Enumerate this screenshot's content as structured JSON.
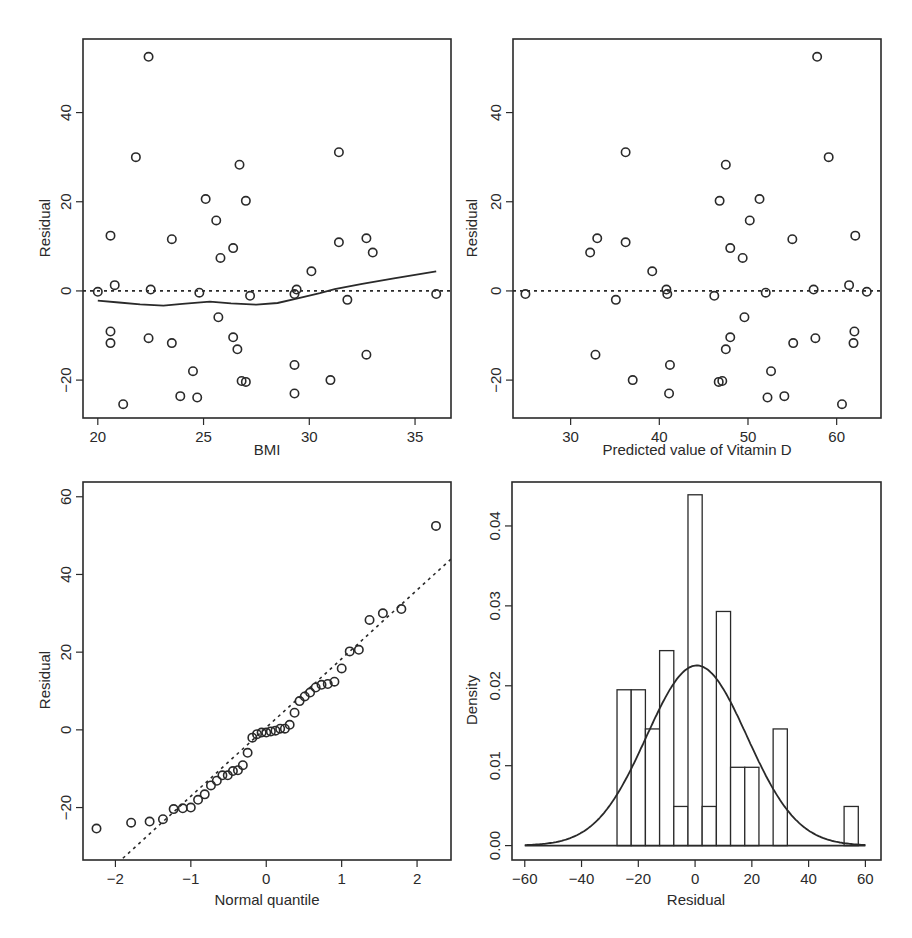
{
  "chart_data": [
    {
      "id": "bmi_residual",
      "type": "scatter",
      "title": "",
      "xlabel": "BMI",
      "ylabel": "Residual",
      "xlim": [
        19.3,
        36.7
      ],
      "ylim": [
        -28.5,
        56.5
      ],
      "xticks": [
        20,
        25,
        30,
        35
      ],
      "yticks": [
        -20,
        0,
        20,
        40
      ],
      "grid": false,
      "reference_line": {
        "type": "horizontal",
        "y": 0,
        "style": "dotted"
      },
      "smoother": {
        "type": "lowess",
        "x": [
          20.0,
          21.0,
          22.0,
          23.1,
          24.0,
          25.3,
          26.3,
          27.5,
          28.5,
          29.5,
          30.5,
          31.2,
          32.5,
          34.0,
          36.0
        ],
        "y": [
          -2.2,
          -2.6,
          -3.0,
          -3.3,
          -2.9,
          -2.4,
          -2.8,
          -3.1,
          -2.7,
          -1.6,
          -0.5,
          0.4,
          1.6,
          2.8,
          4.4
        ]
      },
      "x": [
        20.0,
        20.6,
        20.8,
        20.6,
        20.6,
        21.2,
        21.8,
        22.4,
        22.5,
        22.4,
        23.5,
        23.5,
        23.9,
        24.5,
        24.7,
        24.8,
        25.1,
        25.6,
        25.8,
        25.7,
        26.4,
        26.4,
        26.6,
        26.7,
        26.8,
        27.0,
        27.0,
        27.2,
        29.3,
        29.3,
        29.4,
        29.3,
        30.1,
        31.0,
        31.4,
        31.4,
        31.8,
        32.7,
        33.0,
        32.7,
        36.0
      ],
      "y": [
        -0.2,
        12.4,
        1.3,
        -9.1,
        -11.7,
        -25.4,
        30.0,
        52.5,
        0.3,
        -10.6,
        11.6,
        -11.7,
        -23.6,
        -18.0,
        -23.9,
        -0.4,
        20.6,
        15.8,
        7.4,
        -5.9,
        9.6,
        -10.4,
        -13.1,
        28.3,
        -20.2,
        -20.4,
        20.2,
        -1.1,
        -16.6,
        -23.0,
        0.3,
        -0.7,
        4.4,
        -20.0,
        31.1,
        10.9,
        -2.0,
        11.8,
        8.6,
        -14.3,
        -0.7
      ]
    },
    {
      "id": "predicted_residual",
      "type": "scatter",
      "title": "",
      "xlabel": "Predicted value of Vitamin D",
      "ylabel": "Residual",
      "xlim": [
        23.5,
        65.0
      ],
      "ylim": [
        -28.5,
        56.5
      ],
      "xticks": [
        30,
        40,
        50,
        60
      ],
      "yticks": [
        -20,
        0,
        20,
        40
      ],
      "grid": false,
      "reference_line": {
        "type": "horizontal",
        "y": 0,
        "style": "dotted"
      },
      "x": [
        24.9,
        32.2,
        33.0,
        32.8,
        35.1,
        36.2,
        36.2,
        37.0,
        39.2,
        40.8,
        40.9,
        41.2,
        41.1,
        46.2,
        46.8,
        46.7,
        47.1,
        47.5,
        47.5,
        48.0,
        48.0,
        49.4,
        49.6,
        50.2,
        51.3,
        52.0,
        52.2,
        52.6,
        54.1,
        55.0,
        55.1,
        57.4,
        57.6,
        57.8,
        59.1,
        60.6,
        61.4,
        61.9,
        62.0,
        62.1,
        63.4
      ],
      "y": [
        -0.7,
        8.6,
        11.8,
        -14.3,
        -2.0,
        31.1,
        10.9,
        -20.0,
        4.4,
        0.3,
        -0.7,
        -16.6,
        -23.0,
        -1.1,
        20.2,
        -20.4,
        -20.2,
        28.3,
        -13.1,
        9.6,
        -10.4,
        7.4,
        -5.9,
        15.8,
        20.6,
        -0.4,
        -23.9,
        -18.0,
        -23.6,
        11.6,
        -11.7,
        0.3,
        -10.6,
        52.5,
        30.0,
        -25.4,
        1.3,
        -11.7,
        -9.1,
        12.4,
        -0.2
      ]
    },
    {
      "id": "normal_qq",
      "type": "scatter",
      "title": "",
      "xlabel": "Normal quantile",
      "ylabel": "Residual",
      "xlim": [
        -2.43,
        2.45
      ],
      "ylim": [
        -33.5,
        63.8
      ],
      "xticks": [
        -2,
        -1,
        0,
        1,
        2
      ],
      "yticks": [
        -20,
        0,
        20,
        40,
        60
      ],
      "grid": false,
      "reference_line": {
        "type": "qq",
        "intercept": 0.6,
        "slope": 17.7,
        "style": "dotted"
      },
      "quantile_method": "qnorm(ppoints(n))",
      "sample": [
        -25.4,
        -23.9,
        -23.6,
        -23.0,
        -20.4,
        -20.2,
        -20.0,
        -18.0,
        -16.6,
        -14.3,
        -13.1,
        -11.7,
        -11.7,
        -10.6,
        -10.4,
        -9.1,
        -5.9,
        -2.0,
        -1.1,
        -0.7,
        -0.7,
        -0.4,
        -0.2,
        0.3,
        0.3,
        1.3,
        4.4,
        7.4,
        8.6,
        9.6,
        10.9,
        11.6,
        11.8,
        12.4,
        15.8,
        20.2,
        20.6,
        28.3,
        30.0,
        31.1,
        52.5
      ]
    },
    {
      "id": "residual_histogram",
      "type": "bar",
      "title": "",
      "xlabel": "Residual",
      "ylabel": "Density",
      "xlim": [
        -64.5,
        65.5
      ],
      "ylim": [
        -0.0018,
        0.0455
      ],
      "xticks": [
        -60,
        -40,
        -20,
        0,
        20,
        40,
        60
      ],
      "yticks": [
        0.0,
        0.01,
        0.02,
        0.03,
        0.04
      ],
      "ytick_labels": [
        "0.00",
        "0.01",
        "0.02",
        "0.03",
        "0.04"
      ],
      "grid": false,
      "bin_width": 5,
      "bins": [
        {
          "from": -27.5,
          "to": -22.5,
          "density": 0.0195
        },
        {
          "from": -22.5,
          "to": -17.5,
          "density": 0.0195
        },
        {
          "from": -17.5,
          "to": -12.5,
          "density": 0.0146
        },
        {
          "from": -12.5,
          "to": -7.5,
          "density": 0.0244
        },
        {
          "from": -7.5,
          "to": -2.5,
          "density": 0.0049
        },
        {
          "from": -2.5,
          "to": 2.5,
          "density": 0.0439
        },
        {
          "from": 2.5,
          "to": 7.5,
          "density": 0.0049
        },
        {
          "from": 7.5,
          "to": 12.5,
          "density": 0.0293
        },
        {
          "from": 12.5,
          "to": 17.5,
          "density": 0.0098
        },
        {
          "from": 17.5,
          "to": 22.5,
          "density": 0.0098
        },
        {
          "from": 22.5,
          "to": 27.5,
          "density": 0.0
        },
        {
          "from": 27.5,
          "to": 32.5,
          "density": 0.0146
        },
        {
          "from": 52.5,
          "to": 57.5,
          "density": 0.0049
        }
      ],
      "normal_curve": {
        "mean": 0.6,
        "sd": 17.7,
        "range": [
          -60,
          60
        ]
      }
    }
  ],
  "panels": {
    "top_left": {
      "xlabel": "BMI",
      "ylabel": "Residual"
    },
    "top_right": {
      "xlabel": "Predicted value of Vitamin D",
      "ylabel": "Residual"
    },
    "bottom_left": {
      "xlabel": "Normal quantile",
      "ylabel": "Residual"
    },
    "bottom_right": {
      "xlabel": "Residual",
      "ylabel": "Density"
    }
  }
}
